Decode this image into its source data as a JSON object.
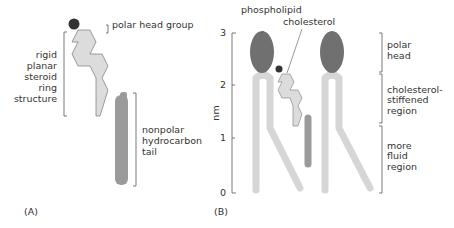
{
  "panel_a": {
    "label": "(A)",
    "head_label": "polar head group",
    "ring_label": [
      "rigid",
      "planar",
      "steroid",
      "ring",
      "structure"
    ],
    "tail_label": [
      "nonpolar",
      "hydrocarbon",
      "tail"
    ]
  },
  "panel_b": {
    "label": "(B)",
    "phospholipid_label": "phospholipid",
    "cholesterol_label": "cholesterol",
    "axis_label": "nm",
    "ticks": [
      "0",
      "1",
      "2",
      "3"
    ],
    "region_head": [
      "polar",
      "head"
    ],
    "region_stiff": [
      "cholesterol-",
      "stiffened",
      "region"
    ],
    "region_fluid": [
      "more",
      "fluid",
      "region"
    ]
  },
  "colors": {
    "head_dark": "#333333",
    "phospho_head": "#707070",
    "tail_dark": "#9a9a9a",
    "ring_fill": "#dcdcdc",
    "lipid_tail": "#d6d6d6"
  }
}
